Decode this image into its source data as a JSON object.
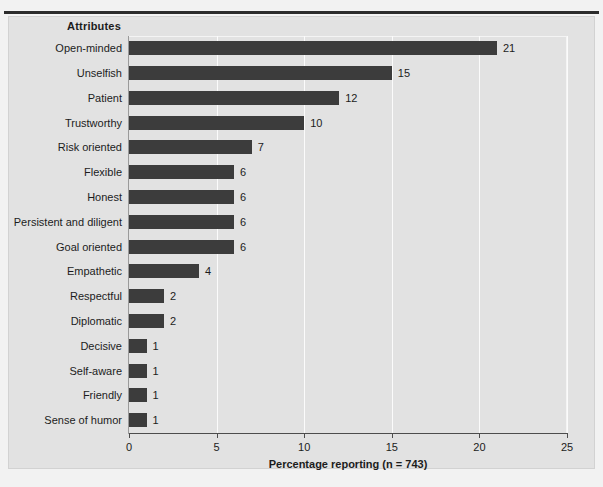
{
  "figure": {
    "background_color": "#e2e2e2",
    "bar_color": "#3c3c3c",
    "rule_color": "#2b2b2b",
    "category_header": "Attributes"
  },
  "chart_data": {
    "type": "bar",
    "orientation": "horizontal",
    "title": "",
    "xlabel": "Percentage reporting (n = 743)",
    "ylabel": "Attributes",
    "xlim": [
      0,
      25
    ],
    "xticks": [
      0,
      5,
      10,
      15,
      20,
      25
    ],
    "xtick_labels": [
      "0",
      "5",
      "10",
      "15",
      "20",
      "25"
    ],
    "grid": "vertical-white",
    "legend": "none",
    "data_labels": true,
    "categories": [
      "Open-minded",
      "Unselfish",
      "Patient",
      "Trustworthy",
      "Risk oriented",
      "Flexible",
      "Honest",
      "Persistent and diligent",
      "Goal oriented",
      "Empathetic",
      "Respectful",
      "Diplomatic",
      "Decisive",
      "Self-aware",
      "Friendly",
      "Sense of humor"
    ],
    "values": [
      21,
      15,
      12,
      10,
      7,
      6,
      6,
      6,
      6,
      4,
      2,
      2,
      1,
      1,
      1,
      1
    ],
    "value_labels": [
      "21",
      "15",
      "12",
      "10",
      "7",
      "6",
      "6",
      "6",
      "6",
      "4",
      "2",
      "2",
      "1",
      "1",
      "1",
      "1"
    ]
  }
}
